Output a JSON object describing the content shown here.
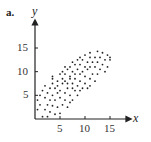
{
  "panel_label": "a.",
  "chart_data": {
    "type": "scatter",
    "title": "",
    "xlabel": "x",
    "ylabel": "y",
    "xlim": [
      0,
      19
    ],
    "ylim": [
      0,
      20
    ],
    "x_ticks": [
      5,
      10,
      15
    ],
    "y_ticks": [
      5,
      10,
      15
    ],
    "grid": false,
    "legend": null,
    "points": [
      [
        1.5,
        0.5
      ],
      [
        2.5,
        0.5
      ],
      [
        4,
        1
      ],
      [
        5,
        1.2
      ],
      [
        0.5,
        2
      ],
      [
        2,
        2
      ],
      [
        3,
        1.5
      ],
      [
        4.5,
        2.5
      ],
      [
        1,
        3
      ],
      [
        2.5,
        3
      ],
      [
        3.5,
        2.8
      ],
      [
        5.5,
        3
      ],
      [
        6.5,
        2.5
      ],
      [
        0.5,
        4
      ],
      [
        2,
        4.5
      ],
      [
        3,
        4
      ],
      [
        4,
        4
      ],
      [
        5,
        4.5
      ],
      [
        6,
        4
      ],
      [
        7,
        3.5
      ],
      [
        7.5,
        4
      ],
      [
        1,
        5
      ],
      [
        2.5,
        5.5
      ],
      [
        3.5,
        5
      ],
      [
        4.5,
        5.5
      ],
      [
        6,
        5.5
      ],
      [
        7,
        5
      ],
      [
        8.5,
        5
      ],
      [
        1.5,
        6
      ],
      [
        3,
        6.5
      ],
      [
        4,
        6.5
      ],
      [
        5,
        6
      ],
      [
        6.5,
        6.5
      ],
      [
        7.5,
        6.5
      ],
      [
        8,
        6
      ],
      [
        9,
        6
      ],
      [
        2,
        7
      ],
      [
        3.5,
        7.5
      ],
      [
        4.5,
        7
      ],
      [
        5.5,
        7.5
      ],
      [
        6.5,
        7.5
      ],
      [
        7.5,
        7.5
      ],
      [
        8.5,
        7
      ],
      [
        9.5,
        6.5
      ],
      [
        10.5,
        6.5
      ],
      [
        3.5,
        8.5
      ],
      [
        4.5,
        8
      ],
      [
        5.5,
        8.5
      ],
      [
        6,
        8
      ],
      [
        7,
        8.5
      ],
      [
        8,
        8.5
      ],
      [
        9,
        8
      ],
      [
        10,
        7.5
      ],
      [
        11,
        7
      ],
      [
        3.5,
        9
      ],
      [
        5,
        9.5
      ],
      [
        6,
        9.5
      ],
      [
        7,
        9
      ],
      [
        8,
        9.5
      ],
      [
        9,
        9.5
      ],
      [
        10,
        9
      ],
      [
        11,
        8.5
      ],
      [
        12,
        8
      ],
      [
        5.5,
        10
      ],
      [
        6.5,
        10.5
      ],
      [
        7.5,
        10
      ],
      [
        8.5,
        10.5
      ],
      [
        9.5,
        10
      ],
      [
        10.5,
        10.5
      ],
      [
        11.5,
        9.5
      ],
      [
        12.5,
        9.5
      ],
      [
        6,
        11
      ],
      [
        7,
        11
      ],
      [
        8,
        11.5
      ],
      [
        9,
        11.5
      ],
      [
        10,
        11
      ],
      [
        11,
        11
      ],
      [
        12,
        11
      ],
      [
        13,
        10.5
      ],
      [
        14,
        10
      ],
      [
        7.5,
        12
      ],
      [
        8.5,
        12.5
      ],
      [
        9.5,
        12.5
      ],
      [
        10.5,
        12
      ],
      [
        11.5,
        12
      ],
      [
        12.5,
        12
      ],
      [
        13.5,
        11.5
      ],
      [
        14.5,
        11
      ],
      [
        9,
        13
      ],
      [
        10,
        13.5
      ],
      [
        11,
        13
      ],
      [
        12,
        13
      ],
      [
        13,
        13
      ],
      [
        14,
        12.5
      ],
      [
        15,
        12.5
      ],
      [
        11,
        14
      ],
      [
        12.5,
        14.3
      ],
      [
        13.5,
        14
      ],
      [
        14.5,
        13.5
      ],
      [
        15,
        13
      ]
    ]
  }
}
